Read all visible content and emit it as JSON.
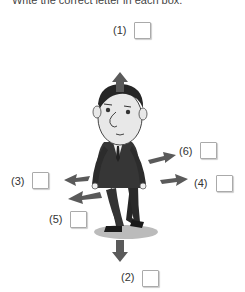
{
  "instruction": "Write the correct letter in each box.",
  "items": [
    {
      "label": "(1)",
      "direction": "up"
    },
    {
      "label": "(2)",
      "direction": "down"
    },
    {
      "label": "(3)",
      "direction": "left"
    },
    {
      "label": "(4)",
      "direction": "right"
    },
    {
      "label": "(5)",
      "direction": "back-left"
    },
    {
      "label": "(6)",
      "direction": "back-right"
    }
  ],
  "figure": {
    "arrow_color": "#5a5a5a"
  }
}
